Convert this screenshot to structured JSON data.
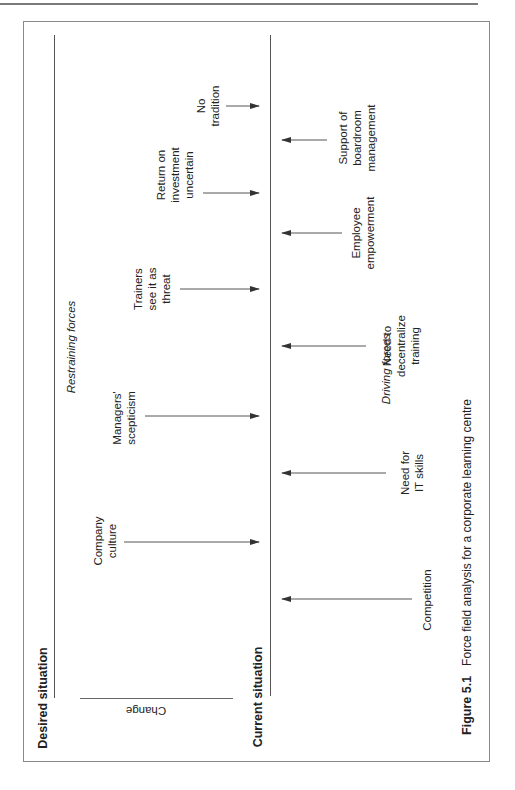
{
  "diagram": {
    "type": "force-field-analysis",
    "orientation": "rotated-90-ccw",
    "labels": {
      "desired_situation": "Desired situation",
      "current_situation": "Current situation",
      "change": "Change",
      "restraining_forces": "Restraining forces",
      "driving_forces": "Driving forces"
    },
    "restraining_forces": [
      {
        "lines": [
          "No",
          "tradition"
        ],
        "label": "No tradition"
      },
      {
        "lines": [
          "Return on",
          "investment",
          "uncertain"
        ],
        "label": "Return on investment uncertain"
      },
      {
        "lines": [
          "Trainers",
          "see it as",
          "threat"
        ],
        "label": "Trainers see it as threat"
      },
      {
        "lines": [
          "Managers'",
          "scepticism"
        ],
        "label": "Managers' scepticism"
      },
      {
        "lines": [
          "Company",
          "culture"
        ],
        "label": "Company culture"
      }
    ],
    "driving_forces": [
      {
        "lines": [
          "Support of",
          "boardroom",
          "management"
        ],
        "label": "Support of boardroom management"
      },
      {
        "lines": [
          "Employee",
          "empowerment"
        ],
        "label": "Employee empowerment"
      },
      {
        "lines": [
          "Need to",
          "decentralize",
          "training"
        ],
        "label": "Need to decentralize training"
      },
      {
        "lines": [
          "Need for",
          "IT skills"
        ],
        "label": "Need for IT skills"
      },
      {
        "lines": [
          "Competition"
        ],
        "label": "Competition"
      }
    ]
  },
  "caption": {
    "figure_number": "Figure 5.1",
    "text": "Force field analysis for a corporate learning centre"
  }
}
